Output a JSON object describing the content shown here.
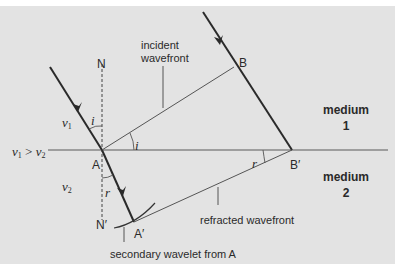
{
  "diagram": {
    "colors": {
      "background": "#e3e3e3",
      "ray": "#2a2a2a",
      "line": "#555555"
    },
    "points": {
      "N": "N",
      "N_prime": "N′",
      "A": "A",
      "A_prime": "A′",
      "B": "B",
      "B_prime": "B′"
    },
    "angles": {
      "incidence_top": "i",
      "incidence_wavefront": "i",
      "refraction_ray": "r",
      "refraction_wavefront": "r"
    },
    "speeds": {
      "v1": "v",
      "v1_sub": "1",
      "v2": "v",
      "v2_sub": "2",
      "compare_a": "v",
      "compare_a_sub": "1",
      "compare_op": " > ",
      "compare_b": "v",
      "compare_b_sub": "2"
    },
    "labels": {
      "incident_wavefront_line1": "incident",
      "incident_wavefront_line2": "wavefront",
      "refracted_wavefront": "refracted wavefront",
      "secondary_wavelet": "secondary wavelet from A",
      "medium1_line1": "medium",
      "medium1_line2": "1",
      "medium2_line1": "medium",
      "medium2_line2": "2"
    }
  }
}
